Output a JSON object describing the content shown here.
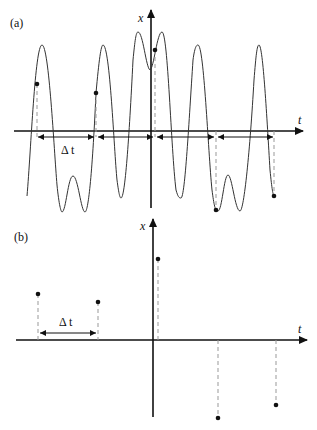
{
  "figure": {
    "panel_a": {
      "label": "(a)",
      "x_axis_label": "t",
      "y_axis_label": "x",
      "interval_label": "Δ t",
      "curve_description": "continuous oscillating signal x(t) sampled at interval Δt",
      "sample_points": [
        {
          "x": 37,
          "y": 84
        },
        {
          "x": 96,
          "y": 93
        },
        {
          "x": 155,
          "y": 50
        },
        {
          "x": 216,
          "y": 210
        },
        {
          "x": 274,
          "y": 196
        }
      ]
    },
    "panel_b": {
      "label": "(b)",
      "x_axis_label": "t",
      "y_axis_label": "x",
      "interval_label": "Δ t",
      "curve_description": "discrete samples of x(t) at interval Δt",
      "sample_points": [
        {
          "x": 38,
          "y": 294
        },
        {
          "x": 98,
          "y": 302
        },
        {
          "x": 158,
          "y": 259
        },
        {
          "x": 218,
          "y": 418
        },
        {
          "x": 276,
          "y": 405
        }
      ]
    },
    "colors": {
      "line": "#222222",
      "dashed": "#888888",
      "background": "#ffffff"
    }
  }
}
